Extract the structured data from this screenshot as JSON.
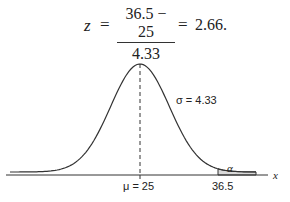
{
  "equation": {
    "lhs": "z",
    "equals": "=",
    "numerator": "36.5 − 25",
    "denominator": "4.33",
    "result": "2.66."
  },
  "diagram": {
    "mean_label": "μ = 25",
    "sigma_label": "σ = 4.33",
    "critical_label": "36.5",
    "tail_label": "α",
    "axis_label": "x",
    "mean": 25,
    "sigma": 4.33,
    "critical_value": 36.5,
    "shade_color": "#d9d9d9",
    "curve_color": "#333333"
  }
}
